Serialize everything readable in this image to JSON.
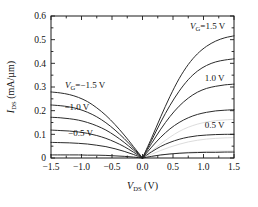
{
  "chart_data": {
    "type": "line",
    "title": "",
    "xlabel": "V_DS (V)",
    "ylabel": "I_DS (mA/µm)",
    "xlim": [
      -1.5,
      1.5
    ],
    "ylim": [
      0,
      0.6
    ],
    "xticks": [
      -1.5,
      -1.0,
      -0.5,
      0.0,
      0.5,
      1.0,
      1.5
    ],
    "xticklabels": [
      "−1.5",
      "−1.0",
      "−0.5",
      "0.0",
      "0.5",
      "1.0",
      "1.5"
    ],
    "yticks": [
      0,
      0.1,
      0.2,
      0.3,
      0.4,
      0.5,
      0.6
    ],
    "yticklabels": [
      "0",
      "0.1",
      "0.2",
      "0.3",
      "0.4",
      "0.5",
      "0.6"
    ],
    "grid": false,
    "legend_position": "inline-annotations",
    "x": [
      0.0,
      0.15,
      0.3,
      0.45,
      0.6,
      0.75,
      0.9,
      1.05,
      1.2,
      1.35,
      1.5
    ],
    "series": [
      {
        "name": "VG = 1.5 V (positive branch)",
        "branch": "positive",
        "values": [
          0.0,
          0.085,
          0.175,
          0.26,
          0.335,
          0.395,
          0.44,
          0.472,
          0.494,
          0.508,
          0.516
        ]
      },
      {
        "name": "VG = 1.25 V (positive branch)",
        "branch": "positive",
        "values": [
          0.0,
          0.075,
          0.152,
          0.222,
          0.282,
          0.331,
          0.367,
          0.391,
          0.406,
          0.414,
          0.419
        ]
      },
      {
        "name": "VG = 1.0 V (positive branch)",
        "branch": "positive",
        "values": [
          0.0,
          0.062,
          0.122,
          0.175,
          0.219,
          0.253,
          0.278,
          0.294,
          0.303,
          0.309,
          0.312
        ]
      },
      {
        "name": "VG = 0.75 V (positive branch)",
        "branch": "positive",
        "values": [
          0.0,
          0.046,
          0.088,
          0.123,
          0.15,
          0.17,
          0.184,
          0.193,
          0.199,
          0.202,
          0.204
        ]
      },
      {
        "name": "VG = 0.5 V (positive branch)",
        "branch": "positive",
        "values": [
          0.0,
          0.026,
          0.049,
          0.066,
          0.079,
          0.088,
          0.094,
          0.097,
          0.099,
          0.1,
          0.1
        ]
      },
      {
        "name": "VG = 0.25 V (positive branch)",
        "branch": "positive",
        "values": [
          0.0,
          0.007,
          0.013,
          0.017,
          0.02,
          0.022,
          0.023,
          0.024,
          0.024,
          0.025,
          0.025
        ]
      },
      {
        "name": "VG = −1.5 V (negative branch)",
        "branch": "negative",
        "values": [
          0.0,
          0.049,
          0.097,
          0.141,
          0.18,
          0.212,
          0.238,
          0.256,
          0.268,
          0.275,
          0.279
        ]
      },
      {
        "name": "VG = −1.25 V (negative branch)",
        "branch": "negative",
        "values": [
          0.0,
          0.042,
          0.082,
          0.118,
          0.149,
          0.174,
          0.193,
          0.207,
          0.216,
          0.221,
          0.224
        ]
      },
      {
        "name": "VG = −1.0 V (negative branch)",
        "branch": "negative",
        "values": [
          0.0,
          0.034,
          0.066,
          0.094,
          0.118,
          0.136,
          0.15,
          0.16,
          0.166,
          0.17,
          0.172
        ]
      },
      {
        "name": "VG = −0.75 V (negative branch)",
        "branch": "negative",
        "values": [
          0.0,
          0.025,
          0.048,
          0.067,
          0.083,
          0.095,
          0.104,
          0.11,
          0.114,
          0.116,
          0.118
        ]
      },
      {
        "name": "VG = −0.5 V (negative branch)",
        "branch": "negative",
        "values": [
          0.0,
          0.015,
          0.028,
          0.039,
          0.048,
          0.054,
          0.059,
          0.062,
          0.064,
          0.065,
          0.066
        ]
      },
      {
        "name": "VG = −0.25 V (negative branch)",
        "branch": "negative",
        "values": [
          0.0,
          0.004,
          0.007,
          0.009,
          0.011,
          0.012,
          0.012,
          0.013,
          0.013,
          0.013,
          0.013
        ]
      }
    ],
    "faint_series": [
      {
        "name": "faint positive overlay A",
        "branch": "positive",
        "values": [
          0.0,
          0.03,
          0.06,
          0.088,
          0.112,
          0.13,
          0.143,
          0.152,
          0.158,
          0.161,
          0.163
        ]
      },
      {
        "name": "faint positive overlay B",
        "branch": "positive",
        "values": [
          0.0,
          0.016,
          0.032,
          0.046,
          0.058,
          0.068,
          0.075,
          0.08,
          0.083,
          0.085,
          0.086
        ]
      },
      {
        "name": "faint positive overlay C",
        "branch": "positive",
        "values": [
          0.0,
          0.006,
          0.012,
          0.017,
          0.021,
          0.024,
          0.026,
          0.028,
          0.029,
          0.029,
          0.03
        ]
      }
    ],
    "annotations": [
      {
        "name": "vg-neg-1p5-label",
        "text": "V_G = −1.5 V",
        "value": -1.5,
        "x": -1.27,
        "y": 0.295
      },
      {
        "name": "vg-neg-1p0-label",
        "text": "−1.0 V",
        "value": -1.0,
        "x": -1.28,
        "y": 0.203
      },
      {
        "name": "vg-neg-0p5-label",
        "text": "−0.5 V",
        "value": -0.5,
        "x": -1.22,
        "y": 0.094
      },
      {
        "name": "vg-pos-1p5-label",
        "text": "V_G = 1.5 V",
        "value": 1.5,
        "x": 0.78,
        "y": 0.545
      },
      {
        "name": "vg-pos-1p0-label",
        "text": "1.0 V",
        "value": 1.0,
        "x": 1.02,
        "y": 0.327
      },
      {
        "name": "vg-pos-0p5-label",
        "text": "0.5 V",
        "value": 0.5,
        "x": 1.02,
        "y": 0.128
      }
    ],
    "colors": {
      "curve": "#2b2b2b",
      "axis": "#1a1a1a",
      "faint": "#d8d8d8",
      "background": "#ffffff"
    }
  }
}
